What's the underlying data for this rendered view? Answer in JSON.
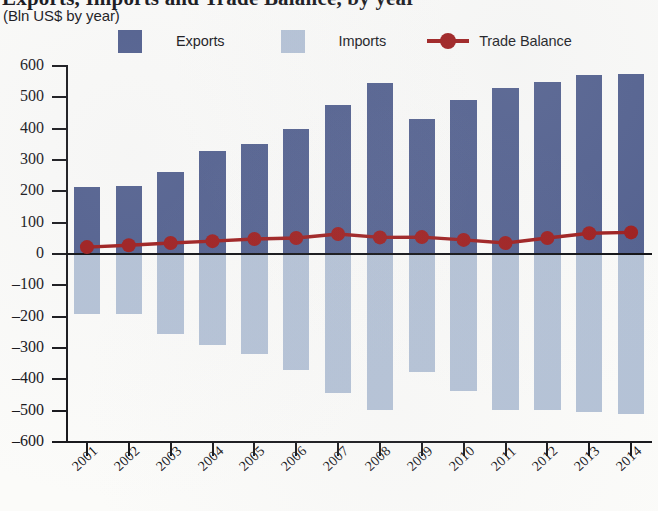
{
  "title": "Exports, Imports and Trade Balance, by year",
  "subtitle": "(Bln US$ by year)",
  "legend": {
    "exports_label": "Exports",
    "imports_label": "Imports",
    "trade_balance_label": "Trade Balance"
  },
  "colors": {
    "exports": "#515f8e",
    "imports": "#b4c2d6",
    "trade_balance": "#9e1b1b",
    "axis": "#17171b",
    "background": "#fbfbf9"
  },
  "chart_data": {
    "type": "bar",
    "title": "Exports, Imports and Trade Balance, by year",
    "subtitle": "(Bln US$ by year)",
    "xlabel": "",
    "ylabel": "(Bln US$ by year)",
    "ylim": [
      -600,
      600
    ],
    "ytick_step": 100,
    "grid": false,
    "legend_position": "top",
    "categories": [
      "2001",
      "2002",
      "2003",
      "2004",
      "2005",
      "2006",
      "2007",
      "2008",
      "2009",
      "2010",
      "2011",
      "2012",
      "2013",
      "2014"
    ],
    "ytick_labels": [
      "600",
      "500",
      "400",
      "300",
      "200",
      "100",
      "0",
      "–100",
      "–200",
      "–300",
      "–400",
      "–500",
      "–600"
    ],
    "ytick_values": [
      600,
      500,
      400,
      300,
      200,
      100,
      0,
      -100,
      -200,
      -300,
      -400,
      -500,
      -600
    ],
    "series": [
      {
        "name": "Exports",
        "type": "bar",
        "color": "#515f8e",
        "values": [
          214,
          217,
          262,
          329,
          351,
          400,
          477,
          547,
          430,
          492,
          530,
          548,
          570,
          574
        ]
      },
      {
        "name": "Imports",
        "type": "bar",
        "color": "#b4c2d6",
        "values": [
          -191,
          -191,
          -255,
          -291,
          -319,
          -370,
          -444,
          -498,
          -377,
          -437,
          -498,
          -498,
          -504,
          -511
        ]
      },
      {
        "name": "Trade Balance",
        "type": "line",
        "color": "#9e1b1b",
        "values": [
          22,
          28,
          35,
          41,
          48,
          51,
          64,
          53,
          54,
          45,
          35,
          51,
          66,
          69
        ]
      }
    ]
  }
}
